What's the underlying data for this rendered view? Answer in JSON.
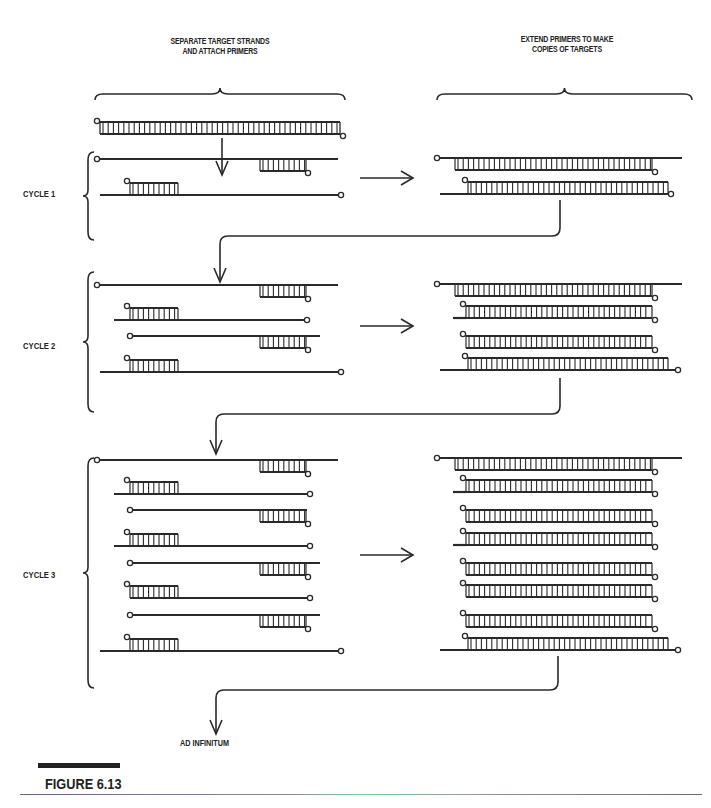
{
  "headers": {
    "left": "SEPARATE TARGET STRANDS\nAND ATTACH PRIMERS",
    "left_line1": "SEPARATE TARGET STRANDS",
    "left_line2": "AND ATTACH PRIMERS",
    "right_line1": "EXTEND PRIMERS TO MAKE",
    "right_line2": "COPIES OF TARGETS"
  },
  "cycles": [
    {
      "label": "CYCLE 1",
      "left_strands": 2,
      "right_duplexes": 2
    },
    {
      "label": "CYCLE 2",
      "left_strands": 4,
      "right_duplexes": 4
    },
    {
      "label": "CYCLE 3",
      "left_strands": 8,
      "right_duplexes": 8
    }
  ],
  "footer": {
    "continuation": "AD INFINITUM",
    "figure_label": "FIGURE 6.13"
  },
  "colors": {
    "ink": "#2a2a2a",
    "background": "#ffffff"
  },
  "diagram": {
    "steps": [
      "Separate target strands and attach primers",
      "Extend primers to make copies of targets"
    ],
    "flow": [
      "Original double-stranded target",
      "Cycle 1",
      "Cycle 2",
      "Cycle 3",
      "Ad infinitum"
    ]
  }
}
